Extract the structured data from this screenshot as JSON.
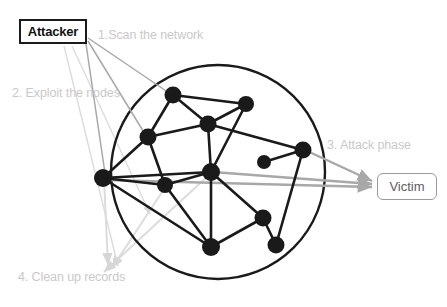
{
  "diagram": {
    "title_nodes": {
      "attacker": "Attacker",
      "victim": "Victim"
    },
    "steps": [
      {
        "id": "scan",
        "label": "1.Scan the network"
      },
      {
        "id": "exploit",
        "label": "2. Exploit the nodes"
      },
      {
        "id": "attack",
        "label": "3. Attack phase"
      },
      {
        "id": "cleanup",
        "label": "4. Clean up records"
      }
    ],
    "colors": {
      "node_fill": "#1a1a1a",
      "edge_stroke": "#1a1a1a",
      "circle_stroke": "#1a1a1a",
      "attacker_border": "#1a1a1a",
      "victim_border": "#9a9a9a",
      "victim_text": "#5d5d5d",
      "step_label_text": "#c9c9c9",
      "arrow_gray_dark": "#a8a8a8",
      "arrow_gray_light": "#dcdcdc",
      "background": "#ffffff"
    },
    "network": {
      "circle": {
        "cx": 218,
        "cy": 172,
        "r": 107
      },
      "nodes": [
        {
          "id": "n1",
          "x": 173,
          "y": 95,
          "r": 8.5
        },
        {
          "id": "n2",
          "x": 246,
          "y": 104,
          "r": 8.0
        },
        {
          "id": "n3",
          "x": 208,
          "y": 124,
          "r": 8.5
        },
        {
          "id": "n4",
          "x": 148,
          "y": 137,
          "r": 8.5
        },
        {
          "id": "n5",
          "x": 303,
          "y": 150,
          "r": 8.5
        },
        {
          "id": "n6",
          "x": 264,
          "y": 162,
          "r": 7.0
        },
        {
          "id": "n7",
          "x": 211,
          "y": 172,
          "r": 9.0
        },
        {
          "id": "n8",
          "x": 103,
          "y": 178,
          "r": 9.0
        },
        {
          "id": "n9",
          "x": 165,
          "y": 185,
          "r": 8.0
        },
        {
          "id": "n10",
          "x": 263,
          "y": 218,
          "r": 8.5
        },
        {
          "id": "n11",
          "x": 211,
          "y": 247,
          "r": 9.0
        },
        {
          "id": "n12",
          "x": 276,
          "y": 245,
          "r": 8.5
        }
      ],
      "edges": [
        [
          "n1",
          "n2"
        ],
        [
          "n1",
          "n3"
        ],
        [
          "n1",
          "n4"
        ],
        [
          "n2",
          "n3"
        ],
        [
          "n2",
          "n7"
        ],
        [
          "n3",
          "n4"
        ],
        [
          "n3",
          "n5"
        ],
        [
          "n3",
          "n7"
        ],
        [
          "n4",
          "n8"
        ],
        [
          "n4",
          "n9"
        ],
        [
          "n5",
          "n6"
        ],
        [
          "n5",
          "n12"
        ],
        [
          "n7",
          "n8"
        ],
        [
          "n7",
          "n9"
        ],
        [
          "n7",
          "n10"
        ],
        [
          "n7",
          "n11"
        ],
        [
          "n8",
          "n11"
        ],
        [
          "n8",
          "n9"
        ],
        [
          "n9",
          "n11"
        ],
        [
          "n10",
          "n11"
        ],
        [
          "n10",
          "n12"
        ]
      ]
    },
    "arrows": {
      "scan_group": [
        {
          "from": [
            88,
            38
          ],
          "to": [
            175,
            97
          ]
        },
        {
          "from": [
            88,
            41
          ],
          "to": [
            148,
            139
          ]
        },
        {
          "from": [
            86,
            44
          ],
          "to": [
            106,
            180
          ]
        }
      ],
      "exploit_group": [
        {
          "from": [
            64,
            46
          ],
          "to": [
            118,
            266
          ]
        },
        {
          "from": [
            72,
            46
          ],
          "to": [
            150,
            214
          ]
        }
      ],
      "attack_group": [
        {
          "from": [
            105,
            180
          ],
          "to": [
            372,
            187
          ]
        },
        {
          "from": [
            213,
            172
          ],
          "to": [
            372,
            184
          ]
        },
        {
          "from": [
            305,
            150
          ],
          "to": [
            372,
            181
          ]
        }
      ],
      "cleanup_group": [
        {
          "from": [
            210,
            174
          ],
          "to": [
            104,
            272
          ]
        },
        {
          "from": [
            166,
            186
          ],
          "to": [
            112,
            268
          ]
        },
        {
          "from": [
            104,
            179
          ],
          "to": [
            108,
            265
          ]
        }
      ]
    }
  }
}
